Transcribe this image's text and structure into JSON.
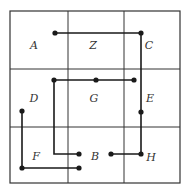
{
  "diagram": {
    "type": "grid-path-puzzle",
    "grid": {
      "rows": 3,
      "cols": 3,
      "left": 10,
      "top": 11,
      "right": 180,
      "bottom": 183,
      "vlines": [
        68,
        124
      ],
      "hlines": [
        69,
        127
      ],
      "line_color": "#333333"
    },
    "cells": [
      {
        "label": "A",
        "row": 0,
        "col": 0,
        "x": 34,
        "y": 49
      },
      {
        "label": "Z",
        "row": 0,
        "col": 1,
        "x": 93,
        "y": 49
      },
      {
        "label": "C",
        "row": 0,
        "col": 2,
        "x": 149,
        "y": 49
      },
      {
        "label": "D",
        "row": 1,
        "col": 0,
        "x": 34,
        "y": 102
      },
      {
        "label": "G",
        "row": 1,
        "col": 1,
        "x": 94,
        "y": 102
      },
      {
        "label": "E",
        "row": 1,
        "col": 2,
        "x": 150,
        "y": 102
      },
      {
        "label": "F",
        "row": 2,
        "col": 0,
        "x": 36,
        "y": 160
      },
      {
        "label": "B",
        "row": 2,
        "col": 1,
        "x": 95,
        "y": 160
      },
      {
        "label": "H",
        "row": 2,
        "col": 2,
        "x": 151,
        "y": 161
      }
    ],
    "paths": [
      {
        "name": "path-1",
        "points": [
          [
            55,
            33
          ],
          [
            141,
            33
          ],
          [
            141,
            154
          ],
          [
            111,
            154
          ]
        ],
        "dots": [
          [
            55,
            33
          ],
          [
            141,
            33
          ],
          [
            141,
            112
          ],
          [
            141,
            154
          ],
          [
            111,
            154
          ]
        ]
      },
      {
        "name": "path-2",
        "points": [
          [
            134,
            80
          ],
          [
            54,
            80
          ],
          [
            54,
            154
          ],
          [
            79,
            154
          ]
        ],
        "dots": [
          [
            134,
            80
          ],
          [
            96,
            80
          ],
          [
            54,
            80
          ],
          [
            79,
            154
          ]
        ]
      },
      {
        "name": "path-3",
        "points": [
          [
            22,
            111
          ],
          [
            22,
            168
          ],
          [
            79,
            168
          ]
        ],
        "dots": [
          [
            22,
            111
          ],
          [
            22,
            168
          ],
          [
            79,
            168
          ]
        ]
      }
    ],
    "path_color": "#1a1a1a",
    "dot_radius": 2.6
  }
}
